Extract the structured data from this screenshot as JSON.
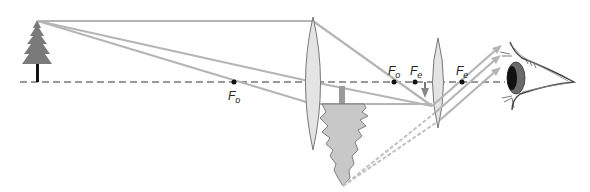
{
  "diagram": {
    "type": "optics-ray-diagram",
    "colors": {
      "axis": "#333333",
      "rays": "#b3b3b3",
      "lens_fill": "#e6e6e6",
      "lens_stroke": "#777777",
      "object": "#7a7a7a",
      "image": "#c8c8c8",
      "focal_point": "#111111"
    },
    "labels": {
      "objective_focus_left": {
        "main": "F",
        "sub": "o"
      },
      "objective_focus_right": {
        "main": "F",
        "sub": "o"
      },
      "eyepiece_focus_left": {
        "main": "F",
        "sub": "e"
      },
      "eyepiece_focus_right": {
        "main": "F",
        "sub": "e"
      }
    },
    "elements": {
      "object": "tree-icon",
      "objective_lens": "objective-lens",
      "intermediate_image": "inverted-tree-image",
      "eyepiece_lens": "eyepiece-lens",
      "observer": "eye-icon"
    }
  }
}
